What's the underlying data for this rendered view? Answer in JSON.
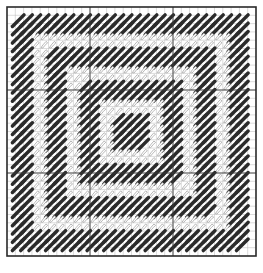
{
  "diagram": {
    "type": "needlepoint-stitch-chart",
    "canvas": {
      "width": 263,
      "height": 273
    },
    "frame": {
      "x": 7,
      "y": 7,
      "size": 249,
      "stroke": "#2a2a2a",
      "stroke_width": 1.6
    },
    "grid": {
      "cells": 30,
      "minor_color": "#b9b9b9",
      "major_color": "#3a3a3a",
      "major_every": 10
    },
    "colors": {
      "background": "#ffffff",
      "dark_stitch": "#2b2b2b",
      "light_stitch_outline": "#9a9a9a"
    },
    "rings": [
      {
        "name": "outer-dark-band",
        "style": "dark",
        "from_cell": 1,
        "to_cell": 3
      },
      {
        "name": "light-band-1",
        "style": "light",
        "from_cell": 3,
        "to_cell": 5
      },
      {
        "name": "dark-band-2",
        "style": "dark",
        "from_cell": 5,
        "to_cell": 7
      },
      {
        "name": "light-band-2",
        "style": "light",
        "from_cell": 7,
        "to_cell": 9
      },
      {
        "name": "dark-band-3",
        "style": "dark",
        "from_cell": 9,
        "to_cell": 11
      },
      {
        "name": "light-band-3",
        "style": "light",
        "from_cell": 11,
        "to_cell": 13
      },
      {
        "name": "center-dark-square",
        "style": "dark",
        "from_cell": 13,
        "to_cell": 15
      }
    ]
  }
}
